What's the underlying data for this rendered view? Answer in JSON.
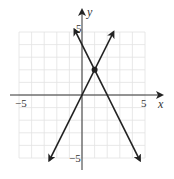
{
  "chart_data": {
    "type": "line",
    "title": "",
    "xlabel": "x",
    "ylabel": "y",
    "xlim": [
      -5.5,
      6.5
    ],
    "ylim": [
      -6,
      7
    ],
    "grid": true,
    "grid_range": {
      "x": [
        -5,
        5
      ],
      "y": [
        -5,
        5
      ]
    },
    "x_tick_labels": [
      {
        "value": -5,
        "label": "−5"
      },
      {
        "value": 5,
        "label": "5"
      }
    ],
    "y_tick_labels": [
      {
        "value": 5,
        "label": "5"
      },
      {
        "value": -5,
        "label": "−5"
      }
    ],
    "series": [
      {
        "name": "y = 2x",
        "slope": 2,
        "intercept": 0,
        "x": [
          -2.6,
          2.5
        ],
        "y": [
          -5.2,
          5.0
        ],
        "arrows": "both"
      },
      {
        "name": "y = -2x + 4",
        "slope": -2,
        "intercept": 4,
        "x": [
          -0.6,
          4.6
        ],
        "y": [
          5.2,
          -5.2
        ],
        "arrows": "both"
      }
    ],
    "points": [
      {
        "name": "intersection",
        "x": 1,
        "y": 2
      }
    ],
    "colors": {
      "line": "#222222",
      "grid": "#e2e2e2",
      "axis": "#333333"
    }
  }
}
